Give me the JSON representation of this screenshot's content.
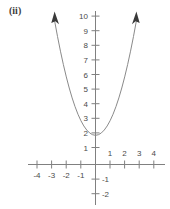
{
  "figure": {
    "part_label": "(ii)",
    "background_color": "#ffffff",
    "axis_color": "#808080",
    "curve_color": "#8a8a8a",
    "arrow_color": "#3a3a3a"
  },
  "chart_data": {
    "type": "line",
    "title": "",
    "subtitle": "",
    "xlabel": "",
    "ylabel": "",
    "grid": false,
    "legend": "none",
    "annotations": [
      "(ii)"
    ],
    "equation": "y = x^2 + 2",
    "xlim": [
      -4.6,
      4.8
    ],
    "ylim": [
      -2.6,
      10.6
    ],
    "x_ticks": [
      -4,
      -3,
      -2,
      -1,
      1,
      2,
      3,
      4
    ],
    "x_tick_labels": [
      "-4",
      "-3",
      "-2",
      "-1",
      "1",
      "2",
      "3",
      "4"
    ],
    "y_ticks": [
      -2,
      -1,
      1,
      2,
      3,
      4,
      5,
      6,
      7,
      8,
      9,
      10
    ],
    "y_tick_labels": [
      "-2",
      "-1",
      "1",
      "2",
      "3",
      "4",
      "5",
      "6",
      "7",
      "8",
      "9",
      "10"
    ],
    "series": [
      {
        "name": "parabola",
        "x": [
          -2.83,
          -2.6,
          -2.4,
          -2.2,
          -2.0,
          -1.8,
          -1.6,
          -1.4,
          -1.2,
          -1.0,
          -0.8,
          -0.6,
          -0.4,
          -0.2,
          0.0,
          0.2,
          0.4,
          0.6,
          0.8,
          1.0,
          1.2,
          1.4,
          1.6,
          1.8,
          2.0,
          2.2,
          2.4,
          2.6,
          2.83
        ],
        "y": [
          10.0,
          8.76,
          7.76,
          6.84,
          6.0,
          5.24,
          4.56,
          3.96,
          3.44,
          3.0,
          2.64,
          2.36,
          2.16,
          2.04,
          2.0,
          2.04,
          2.16,
          2.36,
          2.64,
          3.0,
          3.44,
          3.96,
          4.56,
          5.24,
          6.0,
          6.84,
          7.76,
          8.76,
          10.0
        ],
        "arrow_start": true,
        "arrow_end": true
      }
    ],
    "vertex": [
      0,
      2
    ]
  }
}
